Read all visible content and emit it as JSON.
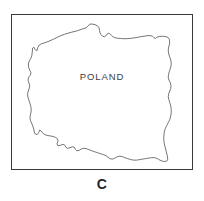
{
  "figure": {
    "caption_letter": "C",
    "frame": {
      "border_color": "#3a3a3a",
      "background_color": "#ffffff"
    }
  },
  "map": {
    "country_label": "POLAND",
    "outline_color": "#5a5a5a",
    "fill_color": "#ffffff",
    "region_type": "country-outline",
    "country": "POLAND"
  }
}
